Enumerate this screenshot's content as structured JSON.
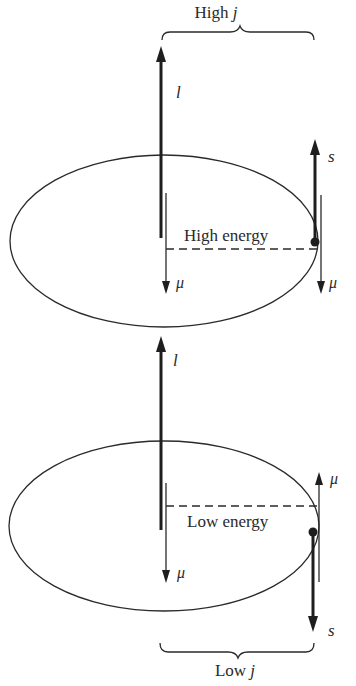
{
  "figure": {
    "top_panel": {
      "brace_label_prefix": "High ",
      "brace_label_var": "j",
      "orbital_vector_label": "l",
      "orbital_moment_label": "μ",
      "spin_vector_label": "s",
      "spin_moment_label": "μ",
      "energy_label": "High energy",
      "spin_direction": "up"
    },
    "bottom_panel": {
      "brace_label_prefix": "Low ",
      "brace_label_var": "j",
      "orbital_vector_label": "l",
      "orbital_moment_label": "μ",
      "spin_vector_label": "s",
      "spin_moment_label": "μ",
      "energy_label": "Low energy",
      "spin_direction": "down"
    },
    "colors": {
      "ink": "#1e1e1e",
      "background": "#ffffff"
    }
  }
}
